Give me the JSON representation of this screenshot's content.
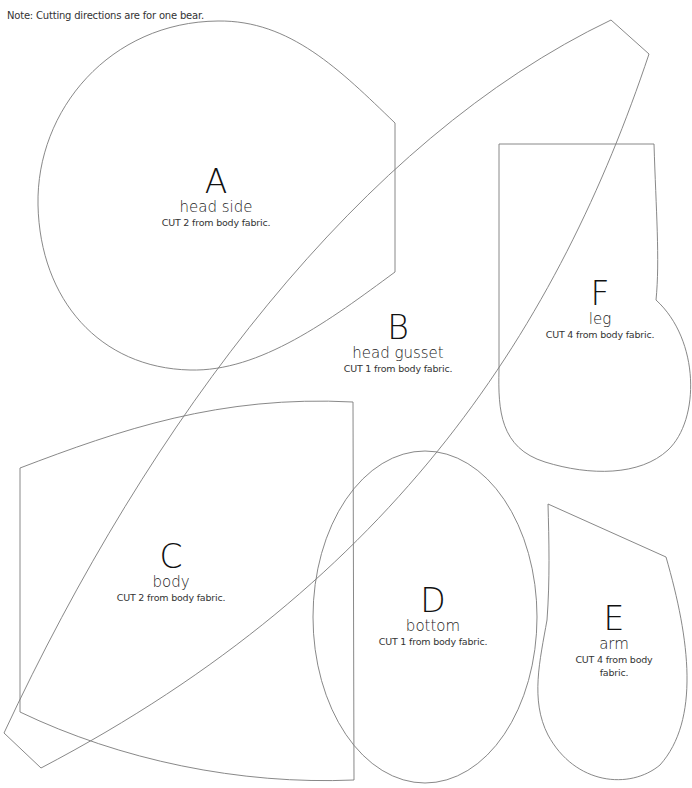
{
  "note": "Note: Cutting directions are for one bear.",
  "pieces": [
    {
      "letter": "A",
      "name": "head side",
      "cut": "CUT 2 from body fabric."
    },
    {
      "letter": "B",
      "name": "head gusset",
      "cut": "CUT 1 from body fabric."
    },
    {
      "letter": "C",
      "name": "body",
      "cut": "CUT 2 from body fabric."
    },
    {
      "letter": "D",
      "name": "bottom",
      "cut": "CUT 1 from body fabric."
    },
    {
      "letter": "E",
      "name": "arm",
      "cut": "CUT 4 from body fabric."
    },
    {
      "letter": "F",
      "name": "leg",
      "cut": "CUT 4 from body fabric."
    }
  ],
  "colors": {
    "outline": "#7a7a7a",
    "text": "#1a1a1a",
    "background": "#ffffff"
  }
}
